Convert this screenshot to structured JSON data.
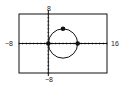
{
  "chart_data": {
    "type": "line",
    "title": "",
    "xlabel": "",
    "ylabel": "",
    "xlim": [
      -8,
      16
    ],
    "ylim": [
      -8,
      8
    ],
    "tick_labels": {
      "xmin": "−8",
      "xmax": "16",
      "ymin": "−8",
      "ymax": "8"
    },
    "x_tick_step": 1,
    "y_tick_step": 1,
    "grid": false,
    "series": [
      {
        "name": "circle",
        "shape": "circle",
        "center": [
          4,
          0
        ],
        "radius": 4
      }
    ],
    "points": [
      {
        "name": "origin",
        "x": 0,
        "y": 0
      },
      {
        "name": "x-intercept",
        "x": 8,
        "y": 0
      },
      {
        "name": "top",
        "x": 4,
        "y": 4
      }
    ],
    "colors": {
      "axis": "#111111",
      "curve": "#111111",
      "frame": "#111111"
    }
  }
}
